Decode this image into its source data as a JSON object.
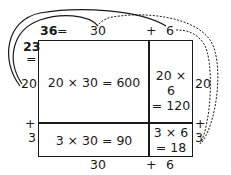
{
  "diagram": {
    "type": "area-model-multiplication",
    "problem": {
      "factor_a": "23",
      "factor_b": "36"
    },
    "top": {
      "total": "36",
      "equals": "=",
      "part1": "30",
      "plus": "+",
      "part2": "6"
    },
    "left": {
      "total": "23",
      "equals": "=",
      "part1": "20",
      "plus": "+",
      "part2": "3"
    },
    "right": {
      "part1": "20",
      "plus": "+",
      "part2": "3"
    },
    "bottom": {
      "part1": "30",
      "plus": "+",
      "part2": "6"
    },
    "cells": {
      "top_left": "20 × 30 = 600",
      "top_right_line1": "20 × 6",
      "top_right_line2": "= 120",
      "bottom_left": "3 × 30 = 90",
      "bottom_right_line1": "3 × 6",
      "bottom_right_line2": "= 18"
    },
    "arrows": [
      {
        "from": "left 20",
        "to": "top 30",
        "style": "solid"
      },
      {
        "from": "left 20",
        "to": "top 6",
        "style": "solid"
      },
      {
        "from": "right 3",
        "to": "top 30",
        "style": "dashed"
      },
      {
        "from": "right 3",
        "to": "top 6",
        "style": "dashed"
      }
    ],
    "colors": {
      "ink": "#1a1a1a",
      "background": "#ffffff"
    }
  }
}
